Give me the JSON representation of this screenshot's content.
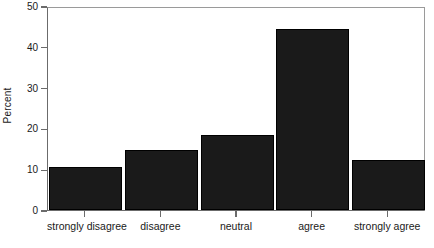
{
  "chart_data": {
    "type": "bar",
    "title": "",
    "xlabel": "",
    "ylabel": "Percent",
    "categories": [
      "strongly disagree",
      "disagree",
      "neutral",
      "agree",
      "strongly agree"
    ],
    "values": [
      10.5,
      14.8,
      18.5,
      44.3,
      12.3
    ],
    "ylim": [
      0,
      50
    ],
    "yticks": [
      0,
      10,
      20,
      30,
      40,
      50
    ],
    "ytick_labels": [
      "0",
      "10",
      "20",
      "30",
      "40",
      "50"
    ],
    "grid": false,
    "legend": null,
    "bar_color": "#1a1a1a",
    "axis_color": "#6b6b6b",
    "background_color": "#ffffff"
  },
  "axes": {
    "y_title": "Percent"
  }
}
